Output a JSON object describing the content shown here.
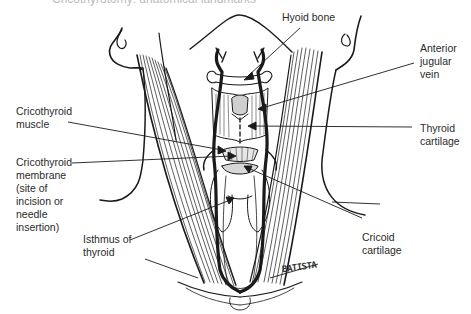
{
  "diagram": {
    "top_caption": "Cricothyrotomy: anatomical landmarks",
    "signature": "BATISTA",
    "labels": {
      "hyoid_bone": [
        "Hyoid bone"
      ],
      "anterior_jugular_vein": [
        "Anterior",
        "jugular",
        "vein"
      ],
      "thyroid_cartilage": [
        "Thyroid",
        "cartilage"
      ],
      "cricoid_cartilage": [
        "Cricoid",
        "cartilage"
      ],
      "cricothyroid_muscle": [
        "Cricothyroid",
        "muscle"
      ],
      "cricothyroid_membrane": [
        "Cricothyroid",
        "membrane",
        "(site of",
        "incision or",
        "needle",
        "insertion)"
      ],
      "isthmus_of_thyroid": [
        "Isthmus of",
        "thyroid"
      ]
    },
    "colors": {
      "line": "#1a1a1a",
      "text": "#2a2a2a",
      "background": "#ffffff"
    }
  }
}
